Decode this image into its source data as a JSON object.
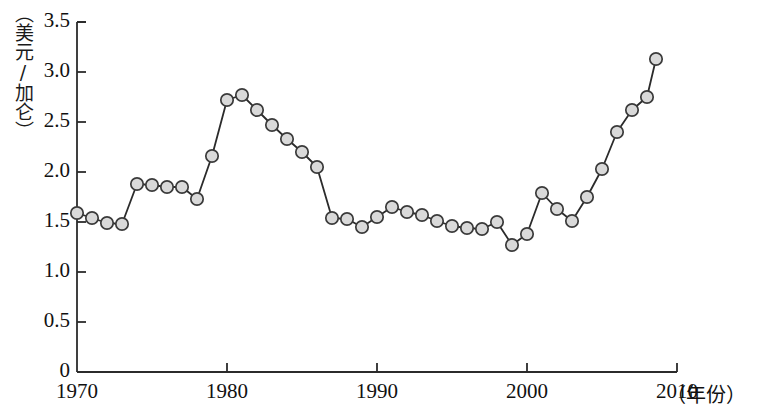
{
  "chart_data": {
    "type": "line",
    "title": "",
    "xlabel": "（年份）",
    "ylabel": "（美元/加仑）",
    "xlim": [
      1970,
      2010
    ],
    "ylim": [
      0,
      3.5
    ],
    "grid": false,
    "legend": null,
    "x_ticks": [
      "1970",
      "1980",
      "1990",
      "2000",
      "2010"
    ],
    "x_tick_values": [
      1970,
      1980,
      1990,
      2000,
      2010
    ],
    "y_ticks": [
      "0",
      "0.5",
      "1.0",
      "1.5",
      "2.0",
      "2.5",
      "3.0",
      "3.5"
    ],
    "y_tick_values": [
      0,
      0.5,
      1.0,
      1.5,
      2.0,
      2.5,
      3.0,
      3.5
    ],
    "marker": "circle",
    "marker_face_color": "#d9d9d9",
    "marker_edge_color": "#3a3a3a",
    "line_color": "#2b2b2b",
    "x": [
      1970,
      1971,
      1972,
      1973,
      1974,
      1975,
      1976,
      1977,
      1978,
      1979,
      1980,
      1981,
      1982,
      1983,
      1984,
      1985,
      1986,
      1987,
      1988,
      1989,
      1990,
      1991,
      1992,
      1993,
      1994,
      1995,
      1996,
      1997,
      1998,
      1999,
      2000,
      2001,
      2002,
      2003,
      2004,
      2005,
      2006,
      2007,
      2008
    ],
    "values": [
      1.59,
      1.54,
      1.49,
      1.48,
      1.88,
      1.87,
      1.85,
      1.85,
      1.73,
      2.16,
      2.72,
      2.77,
      2.62,
      2.47,
      2.33,
      2.2,
      2.05,
      1.54,
      1.53,
      1.45,
      1.55,
      1.65,
      1.6,
      1.57,
      1.51,
      1.46,
      1.44,
      1.43,
      1.5,
      1.27,
      1.38,
      1.79,
      1.63,
      1.51,
      1.75,
      2.03,
      2.4,
      2.62,
      2.75
    ],
    "series": [
      {
        "name": "汽油价格",
        "values": [
          1.59,
          1.54,
          1.49,
          1.48,
          1.88,
          1.87,
          1.85,
          1.85,
          1.73,
          2.16,
          2.72,
          2.77,
          2.62,
          2.47,
          2.33,
          2.2,
          2.05,
          1.54,
          1.53,
          1.45,
          1.55,
          1.65,
          1.6,
          1.57,
          1.51,
          1.46,
          1.44,
          1.43,
          1.5,
          1.27,
          1.38,
          1.79,
          1.63,
          1.51,
          1.75,
          2.03,
          2.4,
          2.62,
          2.75
        ]
      }
    ],
    "extra_point": {
      "x": 2008.6,
      "y": 3.13
    }
  }
}
